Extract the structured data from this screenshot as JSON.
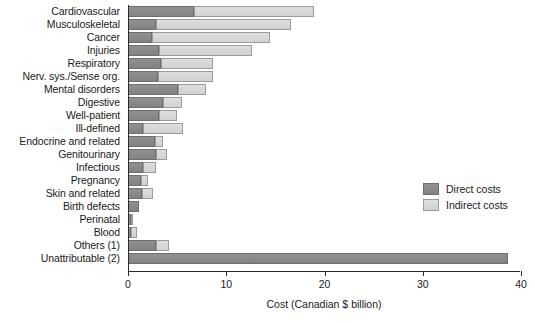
{
  "chart_data": {
    "type": "bar",
    "orientation": "horizontal",
    "stacked": true,
    "title": "",
    "xlabel": "Cost (Canadian $ billion)",
    "ylabel": "",
    "xlim": [
      0,
      40.2
    ],
    "xticks": [
      0,
      10,
      20,
      30,
      40
    ],
    "xticklabels": [
      "0",
      "10",
      "20",
      "30",
      "40"
    ],
    "grid": false,
    "legend_position": "right-middle",
    "categories": [
      "Cardiovascular",
      "Musculoskeletal",
      "Cancer",
      "Injuries",
      "Respiratory",
      "Nerv. sys./Sense org.",
      "Mental disorders",
      "Digestive",
      "Well-patient",
      "Ill-defined",
      "Endocrine and related",
      "Genitourinary",
      "Infectious",
      "Pregnancy",
      "Skin and related",
      "Birth defects",
      "Perinatal",
      "Blood",
      "Others (1)",
      "Unattributable (2)"
    ],
    "series": [
      {
        "name": "Direct costs",
        "color": "#8a8a8a",
        "values": [
          6.7,
          2.8,
          2.4,
          3.2,
          3.4,
          3.1,
          5.1,
          3.6,
          3.2,
          1.5,
          2.7,
          2.9,
          1.5,
          1.3,
          1.4,
          1.1,
          0.3,
          0.3,
          2.9,
          38.7
        ]
      },
      {
        "name": "Indirect costs",
        "color": "#d8d8d8",
        "values": [
          12.2,
          13.8,
          12.1,
          9.4,
          5.3,
          5.6,
          2.8,
          1.9,
          1.8,
          4.1,
          0.9,
          1.1,
          1.4,
          0.7,
          1.1,
          0.0,
          0.2,
          0.6,
          1.3,
          0.0
        ]
      }
    ],
    "totals": [
      18.9,
      16.6,
      14.5,
      12.6,
      8.7,
      8.7,
      7.9,
      5.5,
      5.0,
      5.6,
      3.6,
      4.0,
      2.9,
      2.0,
      2.5,
      1.1,
      0.5,
      0.9,
      4.2,
      38.7
    ]
  },
  "legend": {
    "items": [
      {
        "label": "Direct costs"
      },
      {
        "label": "Indirect costs"
      }
    ]
  }
}
